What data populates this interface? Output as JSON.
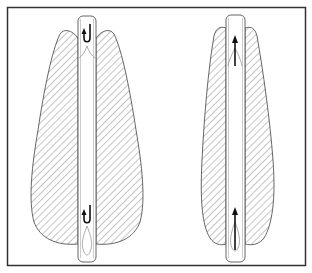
{
  "diagram": {
    "frame": {
      "x": 7,
      "y": 7,
      "width": 299,
      "height": 259,
      "stroke": "#333333"
    },
    "colors": {
      "outline": "#555555",
      "hatch": "#8a8a8a",
      "arrow": "#111111",
      "background": "#ffffff"
    },
    "figures": [
      {
        "id": "left",
        "flow_type": "recirculating",
        "arrow_icon": "curved-hook-arrow",
        "arrow_count": 2
      },
      {
        "id": "right",
        "flow_type": "straight-upward",
        "arrow_icon": "straight-up-arrow",
        "arrow_count": 2
      }
    ]
  }
}
